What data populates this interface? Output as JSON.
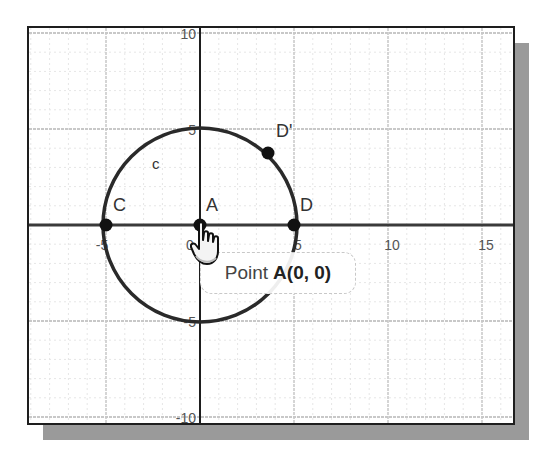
{
  "window": {
    "title": "GeoGebra Graphics View"
  },
  "graph": {
    "axes": {
      "x_ticks": [
        {
          "value": -10,
          "label": "0"
        },
        {
          "value": -5,
          "label": "-5"
        },
        {
          "value": 0,
          "label": "0"
        },
        {
          "value": 5,
          "label": "5"
        },
        {
          "value": 10,
          "label": "10"
        },
        {
          "value": 15,
          "label": "15"
        }
      ],
      "y_ticks": [
        {
          "value": 10,
          "label": "10"
        },
        {
          "value": 5,
          "label": "5"
        },
        {
          "value": -5,
          "label": "-5"
        },
        {
          "value": -10,
          "label": "-10"
        }
      ],
      "x_range": [
        -9,
        16.5
      ],
      "y_range": [
        -10.5,
        10.3
      ]
    },
    "circle": {
      "name": "c",
      "label": "c",
      "center": [
        0,
        0
      ],
      "radius": 5
    },
    "points": [
      {
        "name": "A",
        "label": "A",
        "x": 0,
        "y": 0
      },
      {
        "name": "C",
        "label": "C",
        "x": -5,
        "y": 0
      },
      {
        "name": "D",
        "label": "D",
        "x": 5,
        "y": 0
      },
      {
        "name": "D'",
        "label": "D'",
        "x": 3.5,
        "y": 3.6
      }
    ],
    "colors": {
      "axis": "#1e1e1e",
      "grid_major": "#c8c8c8",
      "grid_minor": "#e6e6e6",
      "circle": "#2a2a2a",
      "point": "#111111"
    }
  },
  "tooltip": {
    "prefix": "Point",
    "value": "A(0, 0)"
  },
  "cursor": {
    "icon": "hand-pointer-icon"
  }
}
